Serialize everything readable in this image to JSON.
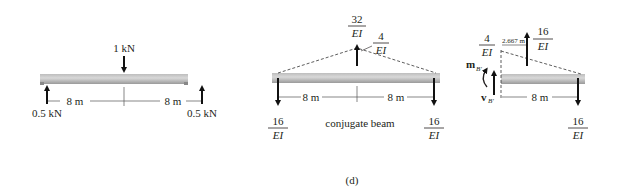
{
  "figure_label": "(d)",
  "colors": {
    "beam_light": "#d2d2d2",
    "beam_dark": "#9c9c9c",
    "ink": "#231f20"
  },
  "real_beam": {
    "point_load": "1 kN",
    "left_reaction": "0.5 kN",
    "right_reaction": "0.5 kN",
    "span_left": "8 m",
    "span_right": "8 m"
  },
  "conjugate_beam": {
    "caption": "conjugate beam",
    "resultant_load": {
      "num": "32",
      "den": "EI"
    },
    "peak_intensity": {
      "num": "4",
      "den": "EI"
    },
    "left_reaction": {
      "num": "16",
      "den": "EI"
    },
    "right_reaction": {
      "num": "16",
      "den": "EI"
    },
    "span_left": "8 m",
    "span_right": "8 m"
  },
  "segment": {
    "left_intensity": {
      "num": "4",
      "den": "EI"
    },
    "resultant_offset": "2.667 m",
    "resultant_load": {
      "num": "16",
      "den": "EI"
    },
    "moment_label": "m",
    "moment_sub": "B′",
    "shear_label": "v",
    "shear_sub": "B′",
    "span": "8 m",
    "right_reaction": {
      "num": "16",
      "den": "EI"
    }
  }
}
